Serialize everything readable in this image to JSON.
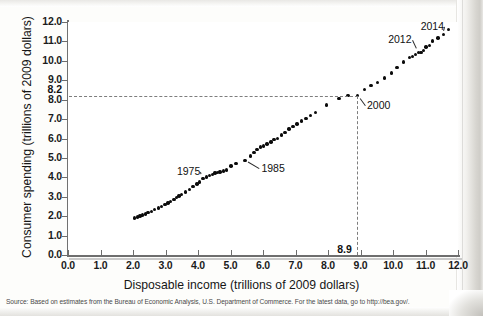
{
  "figure": {
    "x_axis_title": "Disposable income (trillions of 2009 dollars)",
    "y_axis_title": "Consumer spending (trillions of 2009 dollars)",
    "source_note": "Source: Based on estimates from the Bureau of Economic Analysis, U.S. Department of Commerce. For the latest data, go to http://bea.gov/."
  },
  "chart_data": {
    "type": "scatter",
    "title": "",
    "xlabel": "Disposable income (trillions of 2009 dollars)",
    "ylabel": "Consumer spending (trillions of 2009 dollars)",
    "xlim": [
      0.0,
      12.0
    ],
    "ylim": [
      0.0,
      12.0
    ],
    "xticks": [
      "0.0",
      "1.0",
      "2.0",
      "3.0",
      "4.0",
      "5.0",
      "6.0",
      "7.0",
      "8.0",
      "9.0",
      "10.0",
      "11.0",
      "12.0"
    ],
    "yticks": [
      "0.0",
      "1.0",
      "2.0",
      "3.0",
      "4.0",
      "5.0",
      "6.0",
      "7.0",
      "8.0",
      "9.0",
      "10.0",
      "11.0",
      "12.0"
    ],
    "grid": false,
    "legend": null,
    "marker_color": "#0b0b0b",
    "guide_color": "#7d7d7d",
    "special_ticks": {
      "x": "8.9",
      "y": "8.2"
    },
    "guides": {
      "horizontal_y": 8.2,
      "vertical_x": 8.9,
      "style": "dashed"
    },
    "annotations": [
      {
        "label": "1975",
        "x": 4.15,
        "y": 3.95,
        "text_x": 3.35,
        "text_y": 4.25
      },
      {
        "label": "1985",
        "x": 5.45,
        "y": 4.88,
        "text_x": 5.95,
        "text_y": 4.45
      },
      {
        "label": "2000",
        "x": 8.9,
        "y": 8.2,
        "text_x": 9.2,
        "text_y": 7.65
      },
      {
        "label": "2012",
        "x": 10.78,
        "y": 10.43,
        "text_x": 9.85,
        "text_y": 11.05
      },
      {
        "label": "2014",
        "x": 11.55,
        "y": 11.35,
        "text_x": 10.85,
        "text_y": 11.75
      }
    ],
    "points": [
      [
        2.05,
        1.9
      ],
      [
        2.14,
        1.96
      ],
      [
        2.22,
        2.01
      ],
      [
        2.3,
        2.07
      ],
      [
        2.38,
        2.12
      ],
      [
        2.46,
        2.18
      ],
      [
        2.56,
        2.25
      ],
      [
        2.67,
        2.33
      ],
      [
        2.78,
        2.42
      ],
      [
        2.88,
        2.51
      ],
      [
        2.98,
        2.6
      ],
      [
        3.08,
        2.68
      ],
      [
        3.16,
        2.76
      ],
      [
        3.26,
        2.86
      ],
      [
        3.33,
        2.95
      ],
      [
        3.41,
        3.03
      ],
      [
        3.5,
        3.12
      ],
      [
        3.62,
        3.24
      ],
      [
        3.74,
        3.38
      ],
      [
        3.85,
        3.52
      ],
      [
        3.97,
        3.66
      ],
      [
        4.05,
        3.76
      ],
      [
        4.15,
        3.95
      ],
      [
        4.26,
        4.02
      ],
      [
        4.36,
        4.1
      ],
      [
        4.44,
        4.16
      ],
      [
        4.52,
        4.22
      ],
      [
        4.6,
        4.24
      ],
      [
        4.68,
        4.27
      ],
      [
        4.78,
        4.32
      ],
      [
        4.88,
        4.38
      ],
      [
        5.02,
        4.58
      ],
      [
        5.17,
        4.7
      ],
      [
        5.45,
        4.88
      ],
      [
        5.62,
        5.1
      ],
      [
        5.72,
        5.28
      ],
      [
        5.82,
        5.42
      ],
      [
        5.92,
        5.56
      ],
      [
        6.02,
        5.62
      ],
      [
        6.12,
        5.72
      ],
      [
        6.24,
        5.82
      ],
      [
        6.34,
        5.95
      ],
      [
        6.44,
        6.0
      ],
      [
        6.56,
        6.18
      ],
      [
        6.68,
        6.32
      ],
      [
        6.8,
        6.48
      ],
      [
        6.92,
        6.62
      ],
      [
        7.04,
        6.75
      ],
      [
        7.18,
        6.9
      ],
      [
        7.32,
        7.02
      ],
      [
        7.46,
        7.18
      ],
      [
        7.62,
        7.34
      ],
      [
        7.95,
        7.72
      ],
      [
        8.34,
        8.05
      ],
      [
        8.62,
        8.2
      ],
      [
        8.9,
        8.2
      ],
      [
        9.12,
        8.52
      ],
      [
        9.32,
        8.72
      ],
      [
        9.52,
        8.9
      ],
      [
        9.74,
        9.12
      ],
      [
        9.96,
        9.38
      ],
      [
        10.12,
        9.66
      ],
      [
        10.32,
        9.94
      ],
      [
        10.5,
        10.18
      ],
      [
        10.6,
        10.22
      ],
      [
        10.7,
        10.32
      ],
      [
        10.78,
        10.43
      ],
      [
        10.86,
        10.42
      ],
      [
        10.94,
        10.52
      ],
      [
        11.02,
        10.72
      ],
      [
        11.12,
        10.78
      ],
      [
        11.22,
        11.02
      ],
      [
        11.38,
        11.18
      ],
      [
        11.55,
        11.35
      ],
      [
        11.7,
        11.62
      ]
    ]
  }
}
